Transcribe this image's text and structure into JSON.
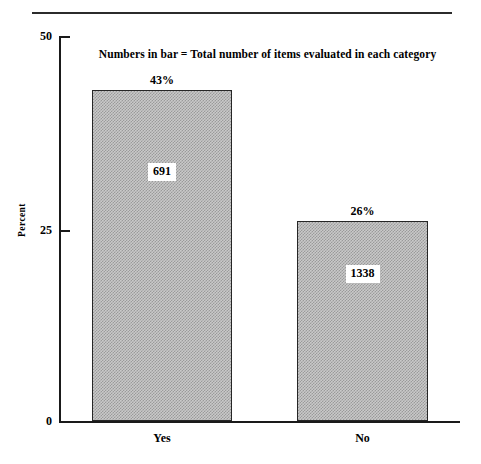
{
  "chart_data": {
    "type": "bar",
    "title": "",
    "subtitle": "Numbers in bar = Total number of items evaluated in each category",
    "categories": [
      "Yes",
      "No"
    ],
    "values": [
      43,
      26
    ],
    "value_labels": [
      "43%",
      "26%"
    ],
    "bar_counts": [
      691,
      1338
    ],
    "bar_count_labels": [
      "691",
      "1338"
    ],
    "xlabel": "",
    "ylabel": "Percent",
    "ylim": [
      0,
      50
    ],
    "yticks": [
      0,
      25,
      50
    ],
    "ytick_labels": [
      "0",
      "25",
      "50"
    ],
    "grid": false,
    "legend": null,
    "bar_fill_color": "#c9c9c9",
    "bar_edge_color": "#262626",
    "axis_color": "#1a1a1a",
    "background_color": "#ffffff"
  },
  "axes": {
    "y": {
      "title": "Percent",
      "ticks": [
        {
          "label": "50",
          "value": 50
        },
        {
          "label": "25",
          "value": 25
        },
        {
          "label": "0",
          "value": 0
        }
      ]
    }
  },
  "annotations": {
    "subtitle": "Numbers in bar = Total number of items evaluated in each category"
  },
  "bars": [
    {
      "category": "Yes",
      "percent_label": "43%",
      "count_label": "691"
    },
    {
      "category": "No",
      "percent_label": "26%",
      "count_label": "1338"
    }
  ]
}
